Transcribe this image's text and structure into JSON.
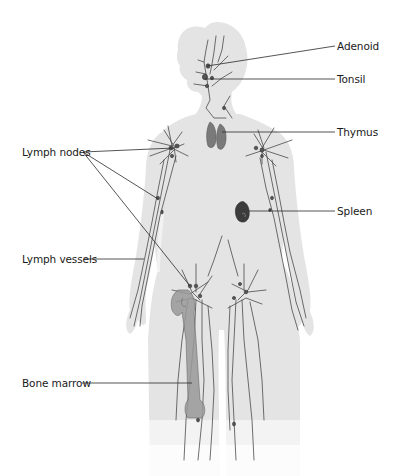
{
  "diagram": {
    "type": "anatomical-illustration",
    "colors": {
      "background": "#ffffff",
      "body_fill": "#e4e4e4",
      "body_edge": "#d2d2d2",
      "vessel": "#4a4a4a",
      "organ": "#6a6a6a",
      "organ_dark": "#3c3c3c",
      "leader_line": "#2a2a2a",
      "label_text": "#1a1a1a"
    },
    "labels": {
      "adenoid": "Adenoid",
      "tonsil": "Tonsil",
      "thymus": "Thymus",
      "lymph_nodes": "Lymph nodes",
      "spleen": "Spleen",
      "lymph_vessels": "Lymph vessels",
      "bone_marrow": "Bone marrow"
    },
    "label_positions": {
      "adenoid": {
        "x": 337,
        "y": 40,
        "side": "right"
      },
      "tonsil": {
        "x": 337,
        "y": 73,
        "side": "right"
      },
      "thymus": {
        "x": 337,
        "y": 126,
        "side": "right"
      },
      "lymph_nodes": {
        "x": 22,
        "y": 146,
        "side": "left"
      },
      "spleen": {
        "x": 337,
        "y": 207,
        "side": "right"
      },
      "lymph_vessels": {
        "x": 22,
        "y": 254,
        "side": "left"
      },
      "bone_marrow": {
        "x": 22,
        "y": 377,
        "side": "left"
      }
    }
  }
}
